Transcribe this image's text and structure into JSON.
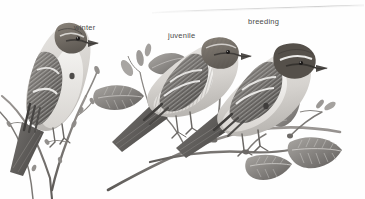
{
  "plate": {
    "name": "sparrow-plumages-plate",
    "background_color": "#fefefe",
    "ink_color": "#5a5a5a",
    "label_color": "#4a4a4a",
    "scan_line_color": "#d8d8d8"
  },
  "labels": {
    "winter": "winter",
    "juvenile": "juvenile",
    "breeding": "breeding"
  },
  "figures": [
    {
      "id": "bird-winter",
      "label": "winter",
      "facing": "right",
      "perch": "bare-twig-with-buds",
      "notes": "pale streaked sparrow, dark eyeline, dark breast spot, two pale wingbars"
    },
    {
      "id": "bird-juvenile",
      "label": "juvenile",
      "facing": "right",
      "perch": "leafy-branch",
      "notes": "heavily streaked crown breast and flanks, brown wings with pale wingbars"
    },
    {
      "id": "bird-breeding",
      "label": "breeding",
      "facing": "right",
      "perch": "leafy-branch",
      "notes": "rufous crown, white supercilium, black eyeline, clean gray underparts, dark flank spot"
    }
  ],
  "botany": {
    "left_twig": "bare budding twig",
    "right_branch": "branch with four ovate serrated leaves and a catkin"
  }
}
